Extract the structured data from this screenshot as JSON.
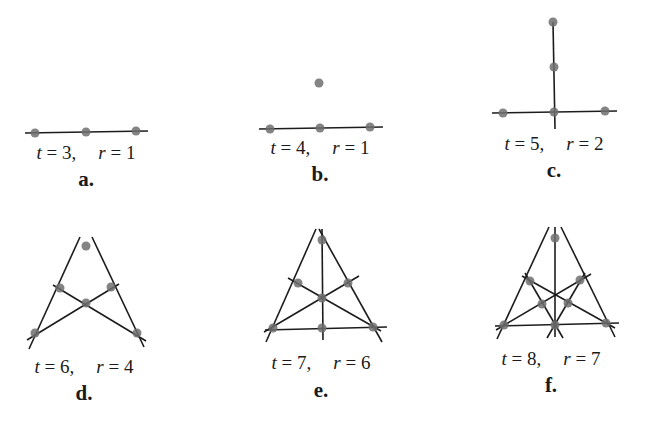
{
  "panels": [
    {
      "id": "a",
      "caption": "a.",
      "t_text": "t = 3,",
      "r_text": "r = 1",
      "t": 3,
      "r": 1,
      "label_pos": [
        86,
        142
      ],
      "caption_pos": [
        86,
        167
      ],
      "points": [
        [
          35,
          133
        ],
        [
          86,
          132
        ],
        [
          136,
          131
        ]
      ],
      "lines": [
        [
          [
            25,
            133
          ],
          [
            148,
            131
          ]
        ]
      ]
    },
    {
      "id": "b",
      "caption": "b.",
      "t_text": "t = 4,",
      "r_text": "r = 1",
      "t": 4,
      "r": 1,
      "label_pos": [
        320,
        137
      ],
      "caption_pos": [
        320,
        162
      ],
      "points": [
        [
          270,
          129
        ],
        [
          320,
          128
        ],
        [
          370,
          127
        ],
        [
          319,
          83
        ]
      ],
      "lines": [
        [
          [
            259,
            129
          ],
          [
            383,
            127
          ]
        ]
      ]
    },
    {
      "id": "c",
      "caption": "c.",
      "t_text": "t = 5,",
      "r_text": "r = 2",
      "t": 5,
      "r": 2,
      "label_pos": [
        554,
        133
      ],
      "caption_pos": [
        554,
        158
      ],
      "points": [
        [
          553,
          22
        ],
        [
          554,
          67
        ],
        [
          554,
          112
        ],
        [
          503,
          113
        ],
        [
          605,
          111
        ]
      ],
      "lines": [
        [
          [
            553,
            22
          ],
          [
            555,
            129
          ]
        ],
        [
          [
            492,
            113
          ],
          [
            617,
            111
          ]
        ]
      ]
    },
    {
      "id": "d",
      "caption": "d.",
      "t_text": "t = 6,",
      "r_text": "r = 4",
      "t": 6,
      "r": 4,
      "label_pos": [
        84,
        356
      ],
      "caption_pos": [
        84,
        381
      ],
      "points": [
        [
          86,
          246
        ],
        [
          60,
          288
        ],
        [
          111,
          287
        ],
        [
          86,
          303
        ],
        [
          35,
          333
        ],
        [
          137,
          333
        ]
      ],
      "lines": [
        [
          [
            80,
            237
          ],
          [
            29,
            349
          ]
        ],
        [
          [
            92,
            237
          ],
          [
            144,
            347
          ]
        ],
        [
          [
            53,
            285
          ],
          [
            146,
            341
          ]
        ],
        [
          [
            119,
            284
          ],
          [
            27,
            340
          ]
        ]
      ]
    },
    {
      "id": "e",
      "caption": "e.",
      "t_text": "t = 7,",
      "r_text": "r = 6",
      "t": 7,
      "r": 6,
      "label_pos": [
        321,
        352
      ],
      "caption_pos": [
        321,
        378
      ],
      "points": [
        [
          322,
          240
        ],
        [
          298,
          283
        ],
        [
          348,
          283
        ],
        [
          322,
          298
        ],
        [
          273,
          328
        ],
        [
          322,
          328
        ],
        [
          373,
          327
        ]
      ],
      "lines": [
        [
          [
            316,
            229
          ],
          [
            266,
            342
          ]
        ],
        [
          [
            319,
            229
          ],
          [
            382,
            342
          ]
        ],
        [
          [
            322,
            229
          ],
          [
            323,
            340
          ]
        ],
        [
          [
            265,
            330
          ],
          [
            387,
            327
          ]
        ],
        [
          [
            288,
            278
          ],
          [
            381,
            331
          ]
        ],
        [
          [
            359,
            276
          ],
          [
            264,
            332
          ]
        ]
      ]
    },
    {
      "id": "f",
      "caption": "f.",
      "t_text": "t = 8,",
      "r_text": "r = 7",
      "t": 8,
      "r": 7,
      "label_pos": [
        551,
        348
      ],
      "caption_pos": [
        551,
        373
      ],
      "points": [
        [
          555,
          238
        ],
        [
          530,
          281
        ],
        [
          580,
          280
        ],
        [
          542,
          304
        ],
        [
          568,
          303
        ],
        [
          504,
          325
        ],
        [
          555,
          325
        ],
        [
          606,
          323
        ]
      ],
      "lines": [
        [
          [
            549,
            227
          ],
          [
            497,
            339
          ]
        ],
        [
          [
            561,
            227
          ],
          [
            615,
            337
          ]
        ],
        [
          [
            555,
            227
          ],
          [
            555,
            337
          ]
        ],
        [
          [
            495,
            326
          ],
          [
            619,
            323
          ]
        ],
        [
          [
            522,
            276
          ],
          [
            615,
            328
          ]
        ],
        [
          [
            591,
            274
          ],
          [
            496,
            330
          ]
        ],
        [
          [
            525,
            273
          ],
          [
            563,
            338
          ]
        ],
        [
          [
            585,
            273
          ],
          [
            547,
            338
          ]
        ]
      ]
    }
  ],
  "colors": {
    "line": "#1c1c1c",
    "point": "#6e6e6e",
    "text": "#1a1a1a"
  }
}
